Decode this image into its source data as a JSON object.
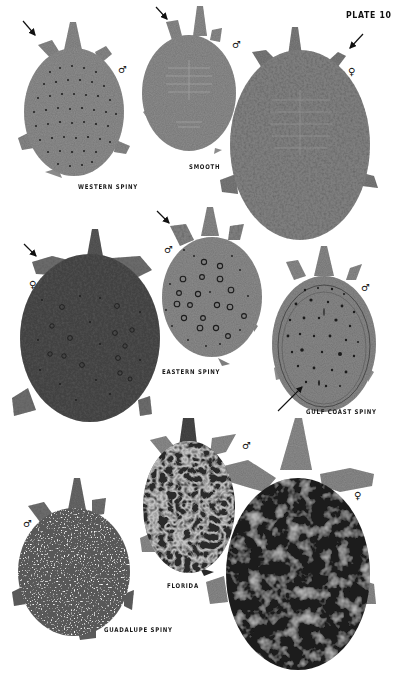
{
  "plate": {
    "title": "PLATE 10",
    "colors": {
      "background": "#ffffff",
      "light_gray_shell": "#8f8f8f",
      "mid_gray_shell": "#7a7a7a",
      "dark_shell": "#3e3e3e",
      "very_dark_shell": "#1f1f1f",
      "spots": "#1e1e1e",
      "label_text": "#1a1a1a"
    }
  },
  "turtles": [
    {
      "id": "western-spiny",
      "label": "WESTERN SPINY",
      "sex": "♂",
      "has_arrow": true,
      "pattern": "small dark dots"
    },
    {
      "id": "smooth-male",
      "label": "SMOOTH",
      "sex": "♂",
      "has_arrow": true,
      "pattern": "plain with faint ribs"
    },
    {
      "id": "smooth-female",
      "label": "",
      "sex": "♀",
      "has_arrow": true,
      "pattern": "mottled speckles"
    },
    {
      "id": "eastern-spiny-female",
      "label": "",
      "sex": "♀",
      "has_arrow": true,
      "pattern": "dark with ocelli"
    },
    {
      "id": "eastern-spiny-male",
      "label": "EASTERN SPINY",
      "sex": "♂",
      "has_arrow": true,
      "pattern": "large ringed ocelli"
    },
    {
      "id": "gulf-coast-spiny",
      "label": "GULF COAST SPINY",
      "sex": "♂",
      "has_arrow": true,
      "pattern": "dark dots with rim lines"
    },
    {
      "id": "florida-male",
      "label": "FLORIDA",
      "sex": "♂",
      "has_arrow": false,
      "pattern": "dark reticulated"
    },
    {
      "id": "florida-female",
      "label": "",
      "sex": "♀",
      "has_arrow": false,
      "pattern": "very dark with pale blotches"
    },
    {
      "id": "guadalupe-spiny",
      "label": "GUADALUPE SPINY",
      "sex": "♂",
      "has_arrow": false,
      "pattern": "fine white speckles"
    }
  ]
}
